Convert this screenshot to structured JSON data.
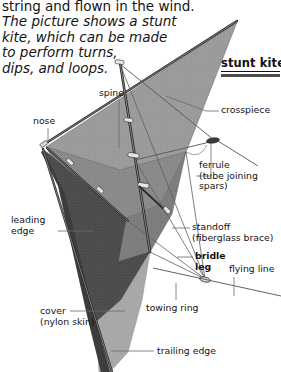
{
  "page": {
    "background_color": "#ffffff",
    "width": 281,
    "height": 372
  },
  "intro": {
    "line1": "string and flown in the wind.",
    "italic_lines": [
      "The picture shows a stunt",
      "kite, which can be made",
      "to perform turns,",
      "dips, and loops."
    ]
  },
  "title": {
    "text": "stunt kite"
  },
  "labels": {
    "spine": {
      "text": "spine"
    },
    "nose": {
      "text": "nose"
    },
    "crosspiece": {
      "text": "crosspiece"
    },
    "ferrule": {
      "line1": "ferrule",
      "line2": "(tube joining",
      "line3": "spars)"
    },
    "leading_edge": {
      "line1": "leading",
      "line2": "edge"
    },
    "standoff": {
      "line1": "standoff",
      "line2": "(fiberglass brace)"
    },
    "bridle_leg": {
      "line1": "bridle",
      "line2": "leg"
    },
    "flying_line": {
      "text": "flying line"
    },
    "towing_ring": {
      "text": "towing ring"
    },
    "cover": {
      "line1": "cover",
      "line2": "(nylon skin)"
    },
    "trailing_edge": {
      "text": "trailing edge"
    }
  },
  "colors": {
    "panel_dark": "#4a4a4a",
    "panel_mid": "#8c8c8c",
    "panel_light": "#b0b0b0",
    "panel_upper": "#9a9a9a",
    "spar": "#2a2a2a",
    "line": "#5a5a5a",
    "text": "#131313",
    "rule": "#4d4d4d"
  }
}
